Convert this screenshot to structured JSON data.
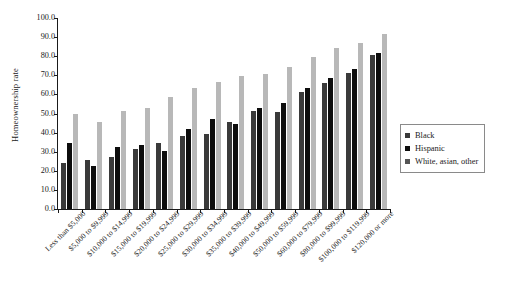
{
  "chart_data": {
    "type": "bar",
    "title": "",
    "xlabel": "",
    "ylabel": "Homeownership rate",
    "ylim": [
      0,
      100
    ],
    "yticks": [
      "0.0",
      "10.0",
      "20.0",
      "30.0",
      "40.0",
      "50.0",
      "60.0",
      "70.0",
      "80.0",
      "90.0",
      "100.0"
    ],
    "ytick_values": [
      0,
      10,
      20,
      30,
      40,
      50,
      60,
      70,
      80,
      90,
      100
    ],
    "grid": false,
    "legend_position": "right",
    "categories": [
      "Less than $5,000",
      "$5,000 to $9,999",
      "$10,000 to $14,999",
      "$15,000 to $19,999",
      "$20,000 to $24,999",
      "$25,000 to $29,999",
      "$30,000 to $34,999",
      "$35,000 to $39,999",
      "$40,000 to $49,999",
      "$50,000 to $59,999",
      "$60,000 to $79,999",
      "$80,000 to $99,999",
      "$100,000 to $119,999",
      "$120,000 or more"
    ],
    "series": [
      {
        "name": "Black",
        "color": "#3a3a3a",
        "values": [
          24.0,
          25.7,
          27.0,
          31.2,
          34.5,
          38.0,
          39.5,
          45.5,
          51.5,
          51.0,
          61.5,
          66.0,
          71.0,
          80.5
        ]
      },
      {
        "name": "Hispanic",
        "color": "#0d0d0d",
        "values": [
          34.5,
          22.3,
          32.5,
          33.5,
          30.5,
          42.0,
          47.0,
          44.5,
          53.0,
          55.5,
          63.5,
          68.5,
          73.5,
          81.5
        ]
      },
      {
        "name": "White, asian, other",
        "color": "#b8b8b8",
        "values": [
          50.0,
          45.5,
          51.5,
          53.0,
          58.5,
          63.5,
          66.5,
          69.5,
          70.5,
          74.5,
          79.5,
          84.5,
          87.0,
          91.5
        ]
      }
    ]
  },
  "legend": {
    "items": [
      {
        "label": "Black"
      },
      {
        "label": "Hispanic"
      },
      {
        "label": "White, asian, other"
      }
    ]
  }
}
